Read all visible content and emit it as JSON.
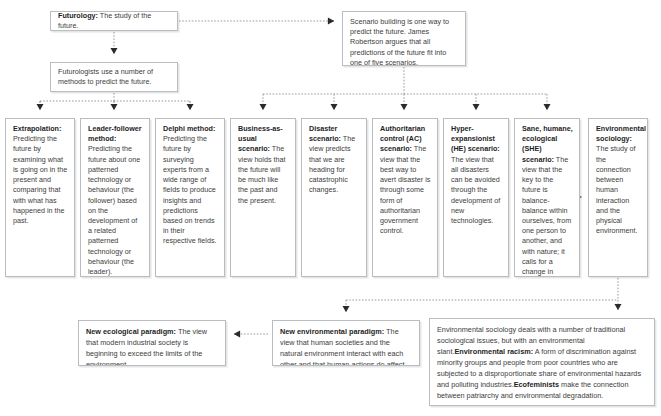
{
  "diagram": {
    "accent_color": "#3d3d3d",
    "border_color": "#b9bcc0",
    "background": "#ffffff"
  },
  "nodes": {
    "futurology": {
      "term": "Futurology:",
      "text": " The study of the future."
    },
    "scenario_building": {
      "text": "Scenario building is one way to predict the future. James Robertson argues that all predictions of the future fit into one of five scenarios."
    },
    "futurologists": {
      "text": "Futurologists use a number of methods to predict the future."
    },
    "extrapolation": {
      "term": "Extrapolation:",
      "text": " Predicting the future by examining what is going on in the present and comparing that with what has happened in the past."
    },
    "leader_follower": {
      "term": "Leader-follower method:",
      "text": " Predicting the future about one patterned technology or behaviour (the follower) based on the development of a related patterned technology or behaviour (the leader)."
    },
    "delphi": {
      "term": "Delphi method:",
      "text": " Predicting the future by surveying experts from a wide range of fields to produce insights and predictions based on trends in their respective fields."
    },
    "business_as_usual": {
      "term": "Business-as-usual scenario:",
      "text": " The view holds that the future will be much like the past and the present."
    },
    "disaster": {
      "term": "Disaster scenario:",
      "text": " The view predicts that we are heading for catastrophic changes."
    },
    "authoritarian_control": {
      "term": "Authoritarian control (AC) scenario:",
      "text": " The view that the best way to avert disaster is through some form of authoritarian government control."
    },
    "hyper_expansionist": {
      "term": "Hyper-expansionist (HE) scenario:",
      "text": " The view that all disasters can be avoided through the development of new technologies."
    },
    "sane_humane_ecological": {
      "term": "Sane, humane, ecological (SHE) scenario:",
      "text": " The view that the key to the future is balance-balance within ourselves, from one person to another, and with nature; it calls for a change in direction."
    },
    "environmental_sociology": {
      "term": "Environmental sociology:",
      "text": " The study of the connection between human interaction and the physical environment."
    },
    "new_ecological_paradigm": {
      "term": "New ecological paradigm:",
      "text": " The view that modern industrial society is beginning to exceed the limits of the environment."
    },
    "new_environmental_paradigm": {
      "term": "New environmental paradigm:",
      "text": " The view that human societies and the natural environment interact with each other and that human actions do affect nature."
    },
    "environmental_sociology_detail": {
      "line1": "Environmental sociology deals with a number of traditional sociological issues, but with an environmental slant.",
      "term2": "Environmental racism:",
      "line2": " A form of discrimination against minority groups and people from poor countries who are subjected to a disproportionate share of environmental hazards and polluting industries.",
      "term3": "Ecofeminists",
      "line3": " make the connection between patriarchy and environmental degradation."
    }
  },
  "connectors": [
    {
      "from": "futurology",
      "to": "scenario_building",
      "style": "dotted-arrow-right"
    },
    {
      "from": "futurology",
      "to": "futurologists",
      "style": "dotted-arrow-down"
    },
    {
      "from": "futurologists",
      "to": "extrapolation",
      "style": "dotted-arrow-down"
    },
    {
      "from": "futurologists",
      "to": "leader_follower",
      "style": "dotted-arrow-down"
    },
    {
      "from": "futurologists",
      "to": "delphi",
      "style": "dotted-arrow-down"
    },
    {
      "from": "scenario_building",
      "to": "business_as_usual",
      "style": "dotted-arrow-down"
    },
    {
      "from": "scenario_building",
      "to": "disaster",
      "style": "dotted-arrow-down"
    },
    {
      "from": "scenario_building",
      "to": "authoritarian_control",
      "style": "dotted-arrow-down"
    },
    {
      "from": "scenario_building",
      "to": "hyper_expansionist",
      "style": "dotted-arrow-down"
    },
    {
      "from": "scenario_building",
      "to": "sane_humane_ecological",
      "style": "dotted-arrow-down"
    },
    {
      "from": "sane_humane_ecological",
      "to": "environmental_sociology",
      "style": "dotted-arrow-right"
    },
    {
      "from": "environmental_sociology",
      "to": "new_environmental_paradigm",
      "style": "dotted-arrow-down"
    },
    {
      "from": "environmental_sociology",
      "to": "environmental_sociology_detail",
      "style": "dotted-arrow-down"
    },
    {
      "from": "new_environmental_paradigm",
      "to": "new_ecological_paradigm",
      "style": "dotted-arrow-left"
    }
  ]
}
